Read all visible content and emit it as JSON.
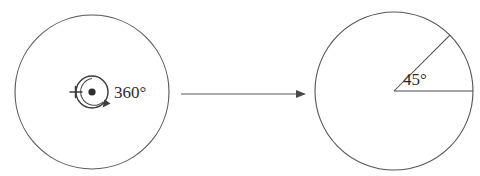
{
  "figure": {
    "background_color": "#ffffff",
    "stroke_color": "#555555",
    "text_color": "#2b2b2b",
    "width": 480,
    "height": 176
  },
  "left_circle": {
    "name": "full-rotation-circle",
    "center_x": 92,
    "center_y": 92,
    "radius": 77,
    "rotation_marker": {
      "name": "rotation-arrow",
      "radius": 16,
      "label": "360°",
      "label_x": 114,
      "label_y": 98,
      "direction": "clockwise",
      "has_center_dot": true,
      "has_tick_mark": true
    }
  },
  "transform_arrow": {
    "name": "transform-arrow",
    "x1": 181,
    "y1": 94,
    "x2": 303,
    "y2": 94,
    "label": ""
  },
  "right_circle": {
    "name": "partial-rotation-circle",
    "center_x": 394,
    "center_y": 91,
    "radius": 79,
    "sector": {
      "name": "angle-sector",
      "label": "45°",
      "label_x": 410,
      "label_y": 86,
      "start_angle_deg": 0,
      "end_angle_deg": 45
    }
  },
  "annotations": {
    "full_turn_label": "360°",
    "partial_turn_label": "45°"
  }
}
